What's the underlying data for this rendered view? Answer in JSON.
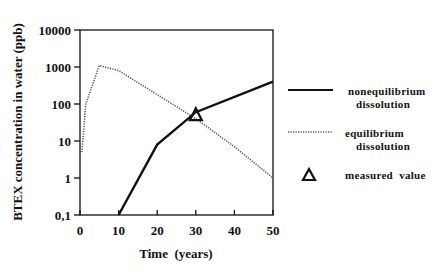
{
  "chart_data": {
    "type": "line",
    "title": "",
    "xlabel": "Time  (years)",
    "ylabel": "BTEX concentration in water (ppb)",
    "xlim": [
      0,
      50
    ],
    "ylim": [
      0.1,
      10000
    ],
    "yscale": "log",
    "grid": false,
    "legend_position": "right, outside plot",
    "x_ticks": [
      "0",
      "10",
      "20",
      "30",
      "40",
      "50"
    ],
    "y_ticks": [
      "0,1",
      "1",
      "10",
      "100",
      "1000",
      "10000"
    ],
    "series": [
      {
        "name": "nonequilibrium dissolution",
        "style": "solid",
        "x": [
          10,
          20,
          30,
          50
        ],
        "y": [
          0.1,
          8,
          60,
          400
        ]
      },
      {
        "name": "equilibrium dissolution",
        "style": "dotted",
        "x": [
          0.5,
          1.5,
          5,
          10,
          20,
          30,
          40,
          50
        ],
        "y": [
          5,
          100,
          1100,
          800,
          180,
          40,
          7,
          1
        ]
      },
      {
        "name": "measured value",
        "style": "triangle marker",
        "x": [
          30
        ],
        "y": [
          50
        ]
      }
    ]
  },
  "legend": {
    "nonequilibrium_line1": "nonequilibrium",
    "nonequilibrium_line2": "dissolution",
    "equilibrium_line1": "equilibrium",
    "equilibrium_line2": "dissolution",
    "measured": "measured  value"
  },
  "axes": {
    "xlabel": "Time  (years)",
    "ylabel": "BTEX concentration in water (ppb)",
    "x_ticks": [
      "0",
      "10",
      "20",
      "30",
      "40",
      "50"
    ],
    "y_ticks": [
      "0,1",
      "1",
      "10",
      "100",
      "1000",
      "10000"
    ]
  }
}
